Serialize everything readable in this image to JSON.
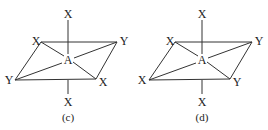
{
  "diagrams": [
    {
      "caption": "(c)",
      "top": "X",
      "bottom": "X",
      "center": "A",
      "top_left": "X",
      "top_right": "Y",
      "bottom_left": "Y",
      "bottom_right": "X"
    },
    {
      "caption": "(d)",
      "top": "X",
      "bottom": "X",
      "center": "A",
      "top_left": "X",
      "top_right": "Y",
      "bottom_left": "X",
      "bottom_right": "Y"
    }
  ]
}
